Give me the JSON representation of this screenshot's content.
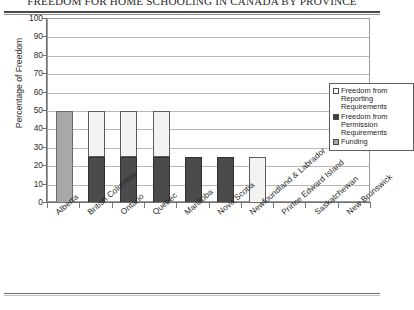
{
  "title": "FREEDOM FOR HOME SCHOOLING IN CANADA BY PROVINCE",
  "legend": {
    "items": [
      {
        "label": "Freedom from Reporting Requirements",
        "swatch": "white",
        "color": "#ffffff"
      },
      {
        "label": "Freedom from Permission Requirements",
        "swatch": "dark",
        "color": "#3f3f3f"
      },
      {
        "label": "Funding",
        "swatch": "gray",
        "color": "#a8a8a8"
      }
    ]
  },
  "chart_data": {
    "type": "bar",
    "subtype": "stacked-bar",
    "title": "FREEDOM FOR HOME SCHOOLING IN CANADA BY PROVINCE",
    "xlabel": "",
    "ylabel": "Percentage of Freedom",
    "ylim": [
      0,
      100
    ],
    "ytick_step": 10,
    "yticks": [
      0,
      10,
      20,
      30,
      40,
      50,
      60,
      70,
      80,
      90,
      100
    ],
    "grid": true,
    "legend_position": "inside-upper-right",
    "categories": [
      "Alberta",
      "British Columbia",
      "Ontario",
      "Quebec",
      "Manitoba",
      "Nova Scotia",
      "Newfoundland & Labrador",
      "Prince Edward Island",
      "Saskatchewan",
      "New Brunswick"
    ],
    "series": [
      {
        "name": "Freedom from Reporting Requirements",
        "color": "#f2f2f0",
        "values": [
          0,
          25,
          25,
          25,
          0,
          0,
          25,
          0,
          0,
          0
        ]
      },
      {
        "name": "Freedom from Permission Requirements",
        "color": "#4b4b4b",
        "values": [
          0,
          25,
          25,
          25,
          25,
          25,
          0,
          0,
          0,
          0
        ]
      },
      {
        "name": "Funding",
        "color": "#a8a8a8",
        "values": [
          50,
          0,
          0,
          0,
          0,
          0,
          0,
          0,
          0,
          0
        ]
      }
    ],
    "totals": [
      50,
      50,
      50,
      50,
      25,
      25,
      25,
      0,
      0,
      0
    ]
  }
}
